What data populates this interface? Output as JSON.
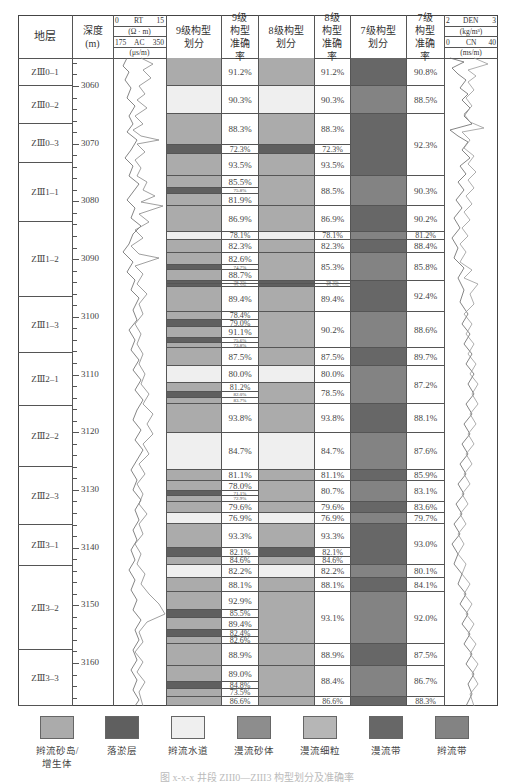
{
  "header": {
    "stratum": "地层",
    "depth": "深度",
    "depth_unit": "(m)",
    "rt_label": "RT",
    "rt_min": "0",
    "rt_max": "15",
    "rt_unit": "(Ω · m)",
    "ac_label": "AC",
    "ac_min": "175",
    "ac_max": "350",
    "ac_unit": "(μs/m)",
    "l9_div": "9级构型划分",
    "l9_acc": "9级构型准确率",
    "l8_div": "8级构型划分",
    "l8_acc": "8级构型准确率",
    "l7_div": "7级构型划分",
    "l7_acc": "7级构型准确率",
    "den_label": "DEN",
    "den_min": "2",
    "den_max": "3",
    "den_unit": "(kg/m³)",
    "cn_label": "CN",
    "cn_min": "0",
    "cn_max": "40",
    "cn_unit": "(ms/m)"
  },
  "colors": {
    "A": "#ababab",
    "B": "#5f5f5f",
    "C": "#efefef",
    "D": "#8d8d8d",
    "E": "#b6b6b6",
    "F": "#676767",
    "G": "#838383"
  },
  "legend": [
    {
      "key": "A",
      "label": "辫流砂岛/增生体"
    },
    {
      "key": "B",
      "label": "落淤层"
    },
    {
      "key": "C",
      "label": "辫流水道"
    },
    {
      "key": "D",
      "label": "漫流砂体"
    },
    {
      "key": "E",
      "label": "漫流细粒"
    },
    {
      "key": "F",
      "label": "漫流带"
    },
    {
      "key": "G",
      "label": "辫流带"
    }
  ],
  "caption": "图 x-x-x 井段 ZIII0—ZIII3 构型划分及准确率",
  "chart_data": {
    "type": "table",
    "depth_axis": {
      "label": "深度 (m)",
      "ticks": [
        3060,
        3070,
        3080,
        3090,
        3100,
        3110,
        3120,
        3130,
        3140,
        3150,
        3160
      ]
    },
    "zones": [
      {
        "name": "ZIII0-1",
        "y0": 58,
        "y1": 86
      },
      {
        "name": "ZIII0-2",
        "y0": 86,
        "y1": 124
      },
      {
        "name": "ZIII0-3",
        "y0": 124,
        "y1": 163
      },
      {
        "name": "ZIII1-1",
        "y0": 163,
        "y1": 222
      },
      {
        "name": "ZIII1-2",
        "y0": 222,
        "y1": 297
      },
      {
        "name": "ZIII1-3",
        "y0": 297,
        "y1": 353
      },
      {
        "name": "ZIII2-1",
        "y0": 353,
        "y1": 406
      },
      {
        "name": "ZIII2-2",
        "y0": 406,
        "y1": 467
      },
      {
        "name": "ZIII2-3",
        "y0": 467,
        "y1": 525
      },
      {
        "name": "ZIII3-1",
        "y0": 525,
        "y1": 566
      },
      {
        "name": "ZIII3-2",
        "y0": 566,
        "y1": 650
      },
      {
        "name": "ZIII3-3",
        "y0": 650,
        "y1": 706
      }
    ],
    "level9": [
      {
        "y0": 58,
        "y1": 86,
        "fill": "A",
        "acc": "91.2%"
      },
      {
        "y0": 86,
        "y1": 114,
        "fill": "C",
        "acc": "90.3%"
      },
      {
        "y0": 114,
        "y1": 145,
        "fill": "A",
        "acc": "88.3%"
      },
      {
        "y0": 145,
        "y1": 154,
        "fill": "B",
        "acc": "72.3%"
      },
      {
        "y0": 154,
        "y1": 176,
        "fill": "A",
        "acc": "93.5%"
      },
      {
        "y0": 176,
        "y1": 188,
        "fill": "A",
        "acc": "85.5%"
      },
      {
        "y0": 188,
        "y1": 194,
        "fill": "B",
        "acc": "75.8%"
      },
      {
        "y0": 194,
        "y1": 206,
        "fill": "A",
        "acc": "81.9%"
      },
      {
        "y0": 206,
        "y1": 232,
        "fill": "A",
        "acc": "86.9%"
      },
      {
        "y0": 232,
        "y1": 240,
        "fill": "C",
        "acc": "78.1%"
      },
      {
        "y0": 240,
        "y1": 253,
        "fill": "A",
        "acc": "82.3%"
      },
      {
        "y0": 253,
        "y1": 265,
        "fill": "A",
        "acc": "82.6%"
      },
      {
        "y0": 265,
        "y1": 270,
        "fill": "B",
        "acc": "74.7%"
      },
      {
        "y0": 270,
        "y1": 281,
        "fill": "A",
        "acc": "88.7%"
      },
      {
        "y0": 281,
        "y1": 284,
        "fill": "B",
        "acc": "78.3%"
      },
      {
        "y0": 284,
        "y1": 287,
        "fill": "B",
        "acc": "75.5%"
      },
      {
        "y0": 287,
        "y1": 312,
        "fill": "A",
        "acc": "89.4%"
      },
      {
        "y0": 312,
        "y1": 320,
        "fill": "A",
        "acc": "78.4%"
      },
      {
        "y0": 320,
        "y1": 327,
        "fill": "B",
        "acc": "79.0%"
      },
      {
        "y0": 327,
        "y1": 338,
        "fill": "A",
        "acc": "91.1%"
      },
      {
        "y0": 338,
        "y1": 343,
        "fill": "B",
        "acc": "75.6%"
      },
      {
        "y0": 343,
        "y1": 348,
        "fill": "A",
        "acc": "73.8%"
      },
      {
        "y0": 348,
        "y1": 366,
        "fill": "A",
        "acc": "87.5%"
      },
      {
        "y0": 366,
        "y1": 383,
        "fill": "C",
        "acc": "80.0%"
      },
      {
        "y0": 383,
        "y1": 392,
        "fill": "A",
        "acc": "81.2%"
      },
      {
        "y0": 392,
        "y1": 398,
        "fill": "B",
        "acc": "82.0%"
      },
      {
        "y0": 398,
        "y1": 404,
        "fill": "A",
        "acc": "83.7%"
      },
      {
        "y0": 404,
        "y1": 433,
        "fill": "A",
        "acc": "93.8%"
      },
      {
        "y0": 433,
        "y1": 470,
        "fill": "C",
        "acc": "84.7%"
      },
      {
        "y0": 470,
        "y1": 481,
        "fill": "A",
        "acc": "81.1%"
      },
      {
        "y0": 481,
        "y1": 491,
        "fill": "A",
        "acc": "78.0%"
      },
      {
        "y0": 491,
        "y1": 496,
        "fill": "B",
        "acc": "71.1%"
      },
      {
        "y0": 496,
        "y1": 502,
        "fill": "A",
        "acc": "72.9%"
      },
      {
        "y0": 502,
        "y1": 513,
        "fill": "A",
        "acc": "79.6%"
      },
      {
        "y0": 513,
        "y1": 524,
        "fill": "C",
        "acc": "76.9%"
      },
      {
        "y0": 524,
        "y1": 548,
        "fill": "A",
        "acc": "93.3%"
      },
      {
        "y0": 548,
        "y1": 557,
        "fill": "B",
        "acc": "82.1%"
      },
      {
        "y0": 557,
        "y1": 565,
        "fill": "A",
        "acc": "84.6%"
      },
      {
        "y0": 565,
        "y1": 578,
        "fill": "C",
        "acc": "82.2%"
      },
      {
        "y0": 578,
        "y1": 592,
        "fill": "A",
        "acc": "88.1%"
      },
      {
        "y0": 592,
        "y1": 610,
        "fill": "A",
        "acc": "92.9%"
      },
      {
        "y0": 610,
        "y1": 618,
        "fill": "B",
        "acc": "85.5%"
      },
      {
        "y0": 618,
        "y1": 630,
        "fill": "A",
        "acc": "89.4%"
      },
      {
        "y0": 630,
        "y1": 637,
        "fill": "B",
        "acc": "82.4%"
      },
      {
        "y0": 637,
        "y1": 644,
        "fill": "A",
        "acc": "82.6%"
      },
      {
        "y0": 644,
        "y1": 666,
        "fill": "A",
        "acc": "88.9%"
      },
      {
        "y0": 666,
        "y1": 682,
        "fill": "A",
        "acc": "89.0%"
      },
      {
        "y0": 682,
        "y1": 689,
        "fill": "B",
        "acc": "84.8%"
      },
      {
        "y0": 689,
        "y1": 697,
        "fill": "A",
        "acc": "73.5%"
      },
      {
        "y0": 697,
        "y1": 706,
        "fill": "A",
        "acc": "86.6%"
      }
    ],
    "level8": [
      {
        "y0": 58,
        "y1": 86,
        "fill": "A",
        "acc": "91.2%"
      },
      {
        "y0": 86,
        "y1": 114,
        "fill": "C",
        "acc": "90.3%"
      },
      {
        "y0": 114,
        "y1": 145,
        "fill": "A",
        "acc": "88.3%"
      },
      {
        "y0": 145,
        "y1": 154,
        "fill": "B",
        "acc": "72.3%"
      },
      {
        "y0": 154,
        "y1": 176,
        "fill": "A",
        "acc": "93.5%"
      },
      {
        "y0": 176,
        "y1": 206,
        "fill": "A",
        "acc": "88.5%"
      },
      {
        "y0": 206,
        "y1": 232,
        "fill": "A",
        "acc": "86.9%"
      },
      {
        "y0": 232,
        "y1": 240,
        "fill": "C",
        "acc": "78.1%"
      },
      {
        "y0": 240,
        "y1": 253,
        "fill": "A",
        "acc": "82.3%"
      },
      {
        "y0": 253,
        "y1": 281,
        "fill": "A",
        "acc": "85.3%"
      },
      {
        "y0": 281,
        "y1": 284,
        "fill": "B",
        "acc": "78.3%"
      },
      {
        "y0": 284,
        "y1": 287,
        "fill": "B",
        "acc": "75.5%"
      },
      {
        "y0": 287,
        "y1": 312,
        "fill": "A",
        "acc": "89.4%"
      },
      {
        "y0": 312,
        "y1": 348,
        "fill": "A",
        "acc": "90.2%"
      },
      {
        "y0": 348,
        "y1": 366,
        "fill": "A",
        "acc": "87.5%"
      },
      {
        "y0": 366,
        "y1": 383,
        "fill": "C",
        "acc": "80.0%"
      },
      {
        "y0": 383,
        "y1": 404,
        "fill": "A",
        "acc": "78.5%"
      },
      {
        "y0": 404,
        "y1": 433,
        "fill": "A",
        "acc": "93.8%"
      },
      {
        "y0": 433,
        "y1": 470,
        "fill": "C",
        "acc": "84.7%"
      },
      {
        "y0": 470,
        "y1": 481,
        "fill": "A",
        "acc": "81.1%"
      },
      {
        "y0": 481,
        "y1": 502,
        "fill": "A",
        "acc": "80.7%"
      },
      {
        "y0": 502,
        "y1": 513,
        "fill": "A",
        "acc": "79.6%"
      },
      {
        "y0": 513,
        "y1": 524,
        "fill": "C",
        "acc": "76.9%"
      },
      {
        "y0": 524,
        "y1": 548,
        "fill": "A",
        "acc": "93.3%"
      },
      {
        "y0": 548,
        "y1": 557,
        "fill": "B",
        "acc": "82.1%"
      },
      {
        "y0": 557,
        "y1": 565,
        "fill": "A",
        "acc": "84.6%"
      },
      {
        "y0": 565,
        "y1": 578,
        "fill": "C",
        "acc": "82.2%"
      },
      {
        "y0": 578,
        "y1": 592,
        "fill": "A",
        "acc": "88.1%"
      },
      {
        "y0": 592,
        "y1": 644,
        "fill": "A",
        "acc": "93.1%"
      },
      {
        "y0": 644,
        "y1": 666,
        "fill": "A",
        "acc": "88.9%"
      },
      {
        "y0": 666,
        "y1": 697,
        "fill": "A",
        "acc": "88.4%"
      },
      {
        "y0": 697,
        "y1": 706,
        "fill": "A",
        "acc": "86.6%"
      }
    ],
    "level7": [
      {
        "y0": 58,
        "y1": 86,
        "fill": "F",
        "acc": "90.8%"
      },
      {
        "y0": 86,
        "y1": 114,
        "fill": "G",
        "acc": "88.5%"
      },
      {
        "y0": 114,
        "y1": 176,
        "fill": "F",
        "acc": "92.3%"
      },
      {
        "y0": 176,
        "y1": 206,
        "fill": "G",
        "acc": "90.3%"
      },
      {
        "y0": 206,
        "y1": 232,
        "fill": "F",
        "acc": "90.2%"
      },
      {
        "y0": 232,
        "y1": 240,
        "fill": "G",
        "acc": "81.2%"
      },
      {
        "y0": 240,
        "y1": 253,
        "fill": "F",
        "acc": "88.4%"
      },
      {
        "y0": 253,
        "y1": 281,
        "fill": "G",
        "acc": "85.8%"
      },
      {
        "y0": 281,
        "y1": 312,
        "fill": "F",
        "acc": "92.4%"
      },
      {
        "y0": 312,
        "y1": 348,
        "fill": "G",
        "acc": "88.6%"
      },
      {
        "y0": 348,
        "y1": 366,
        "fill": "F",
        "acc": "89.7%"
      },
      {
        "y0": 366,
        "y1": 404,
        "fill": "G",
        "acc": "87.2%"
      },
      {
        "y0": 404,
        "y1": 433,
        "fill": "F",
        "acc": "88.1%"
      },
      {
        "y0": 433,
        "y1": 470,
        "fill": "G",
        "acc": "87.6%"
      },
      {
        "y0": 470,
        "y1": 481,
        "fill": "F",
        "acc": "85.9%"
      },
      {
        "y0": 481,
        "y1": 502,
        "fill": "G",
        "acc": "83.1%"
      },
      {
        "y0": 502,
        "y1": 513,
        "fill": "F",
        "acc": "83.6%"
      },
      {
        "y0": 513,
        "y1": 524,
        "fill": "G",
        "acc": "79.7%"
      },
      {
        "y0": 524,
        "y1": 565,
        "fill": "F",
        "acc": "93.0%"
      },
      {
        "y0": 565,
        "y1": 578,
        "fill": "G",
        "acc": "80.1%"
      },
      {
        "y0": 578,
        "y1": 592,
        "fill": "F",
        "acc": "84.1%"
      },
      {
        "y0": 592,
        "y1": 644,
        "fill": "G",
        "acc": "92.0%"
      },
      {
        "y0": 644,
        "y1": 666,
        "fill": "F",
        "acc": "87.5%"
      },
      {
        "y0": 666,
        "y1": 697,
        "fill": "G",
        "acc": "86.7%"
      },
      {
        "y0": 697,
        "y1": 706,
        "fill": "F",
        "acc": "88.3%"
      }
    ]
  }
}
